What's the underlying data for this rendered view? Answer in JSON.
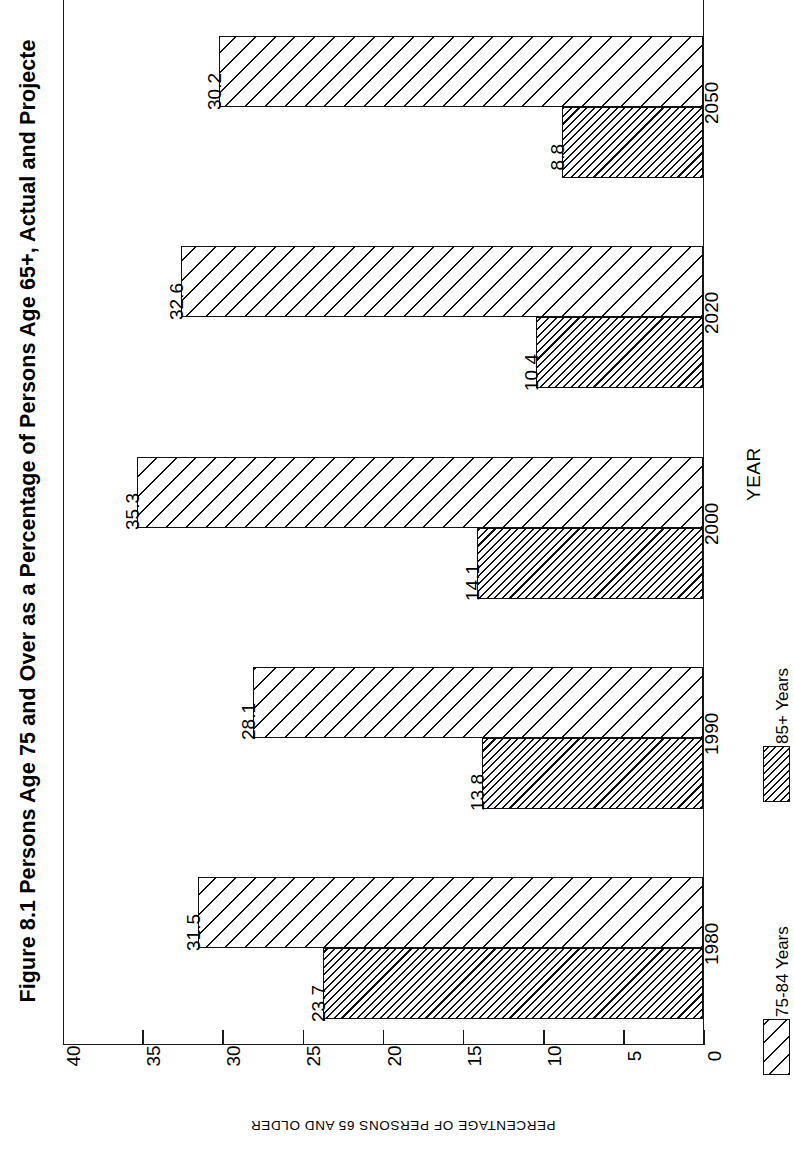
{
  "figure": {
    "title": "Figure 8.1 Persons Age 75 and Over as a Percentage of Persons Age 65+, Actual and Projecte"
  },
  "chart_data": {
    "type": "bar",
    "title": "Figure 8.1 Persons Age 75 and Over as a Percentage of Persons Age 65+, Actual and Projecte",
    "orientation": "vertical-rotated",
    "categories": [
      "1980",
      "1990",
      "2000",
      "2020",
      "2050"
    ],
    "series": [
      {
        "name": "75-84 Years",
        "hatch": "light",
        "values": [
          30.2,
          32.6,
          35.3,
          28.1,
          31.5
        ]
      },
      {
        "name": "85+ Years",
        "hatch": "dense",
        "values": [
          8.8,
          10.4,
          14.1,
          13.8,
          23.7
        ]
      }
    ],
    "xlabel": "YEAR",
    "ylabel": "PERCENTAGE OF PERSONS 65 AND OLDER",
    "ylim": [
      0,
      40
    ],
    "yticks": [
      "0",
      "5",
      "10",
      "15",
      "20",
      "25",
      "30",
      "35",
      "40"
    ],
    "ytick_values": [
      0,
      5,
      10,
      15,
      20,
      25,
      30,
      35,
      40
    ],
    "grid": false,
    "legend_position": "bottom-right",
    "legend": [
      "75-84 Years",
      "85+ Years"
    ],
    "colors": {
      "ink": "#111111",
      "background": "#ffffff"
    }
  },
  "axes": {
    "value_axis_title": "PERCENTAGE OF PERSONS 65 AND OLDER",
    "category_axis_title": "YEAR"
  },
  "legend": {
    "entries": [
      {
        "label": "75-84 Years",
        "hatch": "light"
      },
      {
        "label": "85+ Years",
        "hatch": "dense"
      }
    ]
  }
}
